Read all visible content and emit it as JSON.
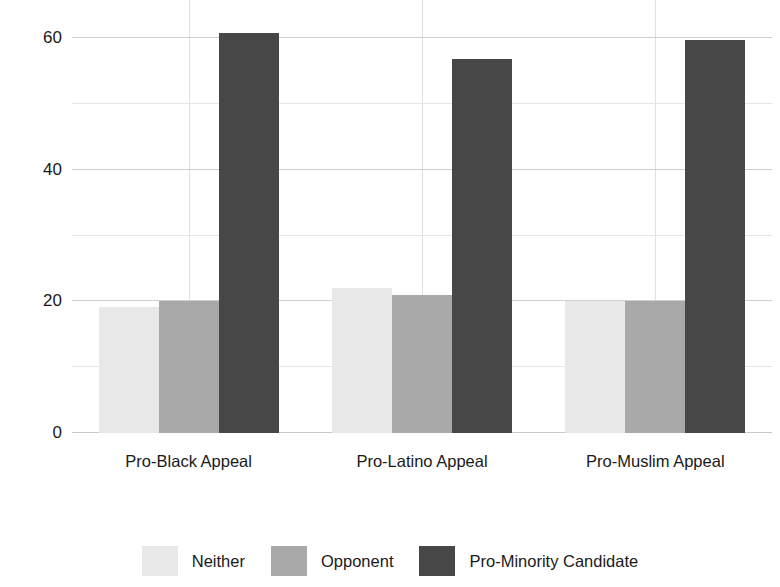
{
  "chart_data": {
    "type": "bar",
    "title": "",
    "subtitle": "",
    "xlabel": "",
    "ylabel": "% of Vote",
    "categories": [
      "Pro-Black Appeal",
      "Pro-Latino Appeal",
      "Pro-Muslim Appeal"
    ],
    "series": [
      {
        "name": "Neither",
        "color": "#e8e8e8",
        "values": [
          19.2,
          22.0,
          20.0
        ]
      },
      {
        "name": "Opponent",
        "color": "#a9a9a9",
        "values": [
          20.0,
          21.0,
          20.0
        ]
      },
      {
        "name": "Pro-Minority Candidate",
        "color": "#474747",
        "values": [
          60.8,
          56.8,
          59.8
        ]
      }
    ],
    "ylim": [
      0,
      64
    ],
    "ytick_labels": [
      "0",
      "20",
      "40",
      "60"
    ],
    "ytick_values": [
      0,
      20,
      40,
      60
    ],
    "minor_gridline_values": [
      10,
      30,
      50
    ],
    "grid": true,
    "legend_position": "bottom",
    "bar_gap_within_group": 0,
    "value_unit": "%"
  },
  "legend": {
    "items": [
      {
        "label": "Neither",
        "color": "#e8e8e8"
      },
      {
        "label": "Opponent",
        "color": "#a9a9a9"
      },
      {
        "label": "Pro-Minority Candidate",
        "color": "#474747"
      }
    ]
  },
  "colors": {
    "background": "#ffffff",
    "text": "#1a1a1a",
    "gridline_major": "#cfcfcf",
    "gridline_minor": "#e6e6e6",
    "axis_baseline": "#c9c9c9"
  }
}
